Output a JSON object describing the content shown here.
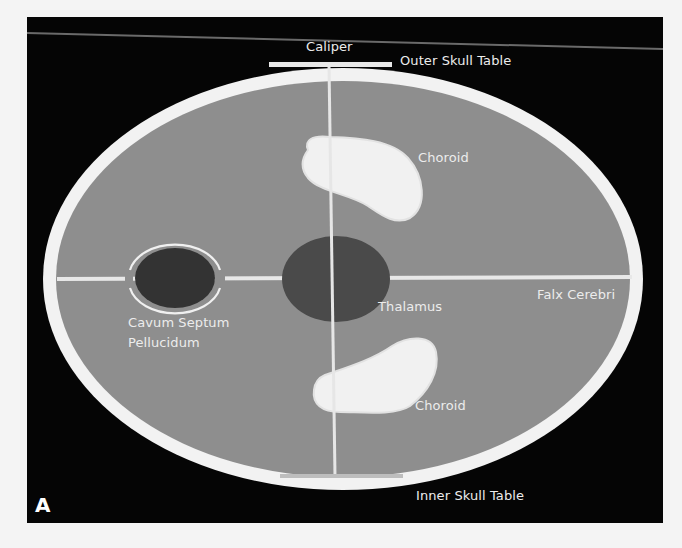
{
  "figure": {
    "panel_letter": "A",
    "background_color": "#050505",
    "brain_color": "#8e8e8e",
    "skull_color": "#f2f2f2",
    "dark_structure_color": "#4a4a4a",
    "csp_color": "#333333"
  },
  "labels": {
    "caliper": "Caliper",
    "outer_skull_table": "Outer Skull Table",
    "choroid_top": "Choroid",
    "choroid_bottom": "Choroid",
    "thalamus": "Thalamus",
    "falx_cerebri": "Falx Cerebri",
    "cavum_line1": "Cavum Septum",
    "cavum_line2": "Pellucidum",
    "inner_skull_table": "Inner Skull Table"
  }
}
